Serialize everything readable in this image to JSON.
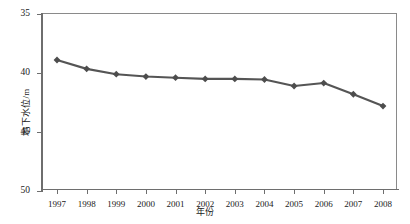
{
  "chart_data": {
    "type": "line",
    "title": "",
    "xlabel": "年份",
    "ylabel": "地下水位/m",
    "categories": [
      "1997",
      "1998",
      "1999",
      "2000",
      "2001",
      "2002",
      "2003",
      "2004",
      "2005",
      "2006",
      "2007",
      "2008"
    ],
    "values": [
      38.9,
      39.65,
      40.1,
      40.3,
      40.4,
      40.5,
      40.5,
      40.55,
      41.1,
      40.85,
      41.8,
      42.8
    ],
    "series": [
      {
        "name": "地下水位",
        "values": [
          38.9,
          39.65,
          40.1,
          40.3,
          40.4,
          40.5,
          40.5,
          40.55,
          41.1,
          40.85,
          41.8,
          42.8
        ]
      }
    ],
    "ylim": [
      35,
      50
    ],
    "y_inverted": true,
    "yticks": [
      35,
      40,
      45,
      50
    ],
    "ytick_labels": [
      "35",
      "40",
      "45",
      "50"
    ],
    "xtick_labels": [
      "1997",
      "1998",
      "1999",
      "2000",
      "2001",
      "2002",
      "2003",
      "2004",
      "2005",
      "2006",
      "2007",
      "2008"
    ],
    "xlim": [
      0,
      11
    ],
    "grid": false,
    "legend": false,
    "legend_position": "none",
    "marker": "diamond",
    "line_color": "#555555",
    "marker_color": "#4d4d4d",
    "axis_color": "#6e6e6e",
    "background_color": "#ffffff"
  }
}
